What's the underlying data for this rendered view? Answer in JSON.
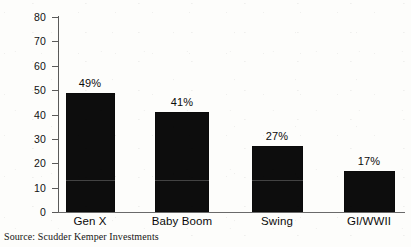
{
  "chart_data": {
    "type": "bar",
    "title": "",
    "subtitle": "",
    "xlabel": "",
    "ylabel": "",
    "categories": [
      "Gen X",
      "Baby Boom",
      "Swing",
      "GI/WWII"
    ],
    "values": [
      49,
      41,
      27,
      17
    ],
    "data_labels": [
      "49%",
      "41%",
      "27%",
      "17%"
    ],
    "ylim": [
      0,
      80
    ],
    "ytick_labels": [
      "80",
      "70",
      "60",
      "50",
      "40",
      "30",
      "20",
      "10",
      "0"
    ],
    "ytick_values": [
      80,
      70,
      60,
      50,
      40,
      30,
      20,
      10,
      0
    ],
    "grid": false,
    "legend": null,
    "bar_color": "#0d0d0d",
    "axis_color": "#5a5a5a",
    "background_color": "#fdfdfb"
  },
  "source_note": "Source: Scudder Kemper Investments"
}
